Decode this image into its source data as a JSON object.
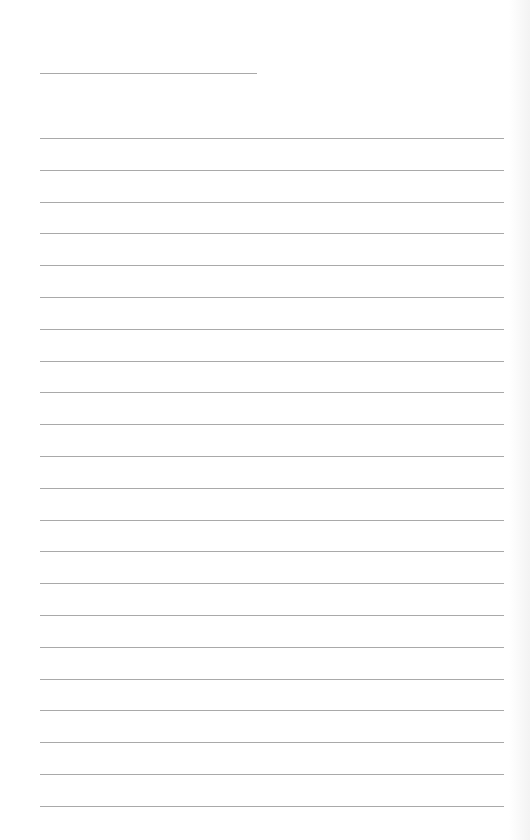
{
  "page": {
    "type": "lined-paper",
    "background_color": "#ffffff",
    "line_color": "#a9a9a9",
    "header_line": {
      "x": 40,
      "y": 73,
      "width": 217
    },
    "body_lines": {
      "x": 40,
      "width": 464,
      "start_y": 138,
      "spacing": 31.8,
      "count": 22
    }
  }
}
